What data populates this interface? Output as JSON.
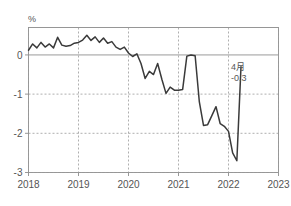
{
  "chart_data": {
    "type": "line",
    "title": "",
    "subtitle": "",
    "xlabel": "",
    "ylabel": "",
    "unit_label": "%",
    "xlim": [
      2018.0,
      2023.0
    ],
    "ylim": [
      -3,
      0.7
    ],
    "grid": true,
    "legend": null,
    "x_tick_labels": [
      "2018",
      "2019",
      "2020",
      "2021",
      "2022",
      "2023"
    ],
    "x_ticks": [
      2018,
      2019,
      2020,
      2021,
      2022,
      2023
    ],
    "y_tick_labels": [
      "0",
      "-1",
      "-2",
      "-3"
    ],
    "y_ticks": [
      0,
      -1,
      -2,
      -3
    ],
    "zero_line": 0,
    "series": [
      {
        "name": "series-1",
        "color": "#3a3a3a",
        "x": [
          2018.0,
          2018.083,
          2018.167,
          2018.25,
          2018.333,
          2018.417,
          2018.5,
          2018.583,
          2018.667,
          2018.75,
          2018.833,
          2018.917,
          2019.0,
          2019.083,
          2019.167,
          2019.25,
          2019.333,
          2019.417,
          2019.5,
          2019.583,
          2019.667,
          2019.75,
          2019.833,
          2019.917,
          2020.0,
          2020.083,
          2020.167,
          2020.25,
          2020.333,
          2020.417,
          2020.5,
          2020.583,
          2020.667,
          2020.75,
          2020.833,
          2020.917,
          2021.0,
          2021.083,
          2021.167,
          2021.25,
          2021.333,
          2021.417,
          2021.5,
          2021.583,
          2021.667,
          2021.75,
          2021.833,
          2021.917,
          2022.0,
          2022.083,
          2022.167,
          2022.25
        ],
        "y": [
          0.12,
          0.28,
          0.18,
          0.32,
          0.2,
          0.28,
          0.18,
          0.45,
          0.25,
          0.22,
          0.24,
          0.3,
          0.32,
          0.38,
          0.5,
          0.37,
          0.46,
          0.32,
          0.43,
          0.3,
          0.34,
          0.2,
          0.14,
          0.2,
          0.05,
          -0.04,
          0.03,
          -0.22,
          -0.6,
          -0.42,
          -0.5,
          -0.22,
          -0.62,
          -0.98,
          -0.82,
          -0.9,
          -0.9,
          -0.88,
          -0.03,
          0.0,
          -0.02,
          -1.2,
          -1.8,
          -1.78,
          -1.55,
          -1.32,
          -1.75,
          -1.82,
          -1.95,
          -2.5,
          -2.7,
          -0.3
        ]
      }
    ],
    "annotations": [
      {
        "name": "last-point-callout",
        "line1": "4月",
        "line2": "-0.3",
        "x": 2022.25,
        "y": -0.3
      }
    ]
  }
}
